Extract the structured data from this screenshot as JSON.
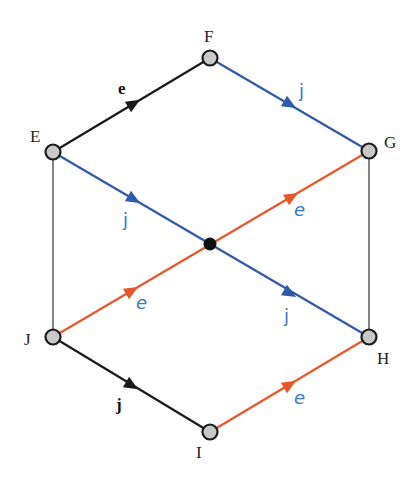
{
  "colors": {
    "black_edge": "#1a1a1a",
    "blue_edge": "#2f5aa8",
    "orange_edge": "#e8572a",
    "thin_edge": "#333333",
    "node_fill": "#c8c8c8",
    "node_stroke": "#1a1a1a",
    "center_fill": "#111111",
    "label_blue": "#3a78c8"
  },
  "nodes": [
    {
      "id": "E",
      "label": "E",
      "x": 53,
      "y": 152
    },
    {
      "id": "F",
      "label": "F",
      "x": 210,
      "y": 58
    },
    {
      "id": "G",
      "label": "G",
      "x": 369,
      "y": 151
    },
    {
      "id": "H",
      "label": "H",
      "x": 369,
      "y": 337
    },
    {
      "id": "I",
      "label": "I",
      "x": 210,
      "y": 432
    },
    {
      "id": "J",
      "label": "J",
      "x": 53,
      "y": 337
    },
    {
      "id": "C",
      "label": "",
      "x": 210,
      "y": 244
    }
  ],
  "edges": [
    {
      "from": "E",
      "to": "F",
      "label": "e",
      "color": "black",
      "arrow": true
    },
    {
      "from": "F",
      "to": "G",
      "label": "j",
      "color": "blue",
      "arrow": true
    },
    {
      "from": "E",
      "to": "H",
      "label": "j",
      "color": "blue",
      "arrow": true,
      "note": "passes through center, two arrows"
    },
    {
      "from": "J",
      "to": "G",
      "label": "e",
      "color": "orange",
      "arrow": true,
      "note": "passes through center, two arrows"
    },
    {
      "from": "J",
      "to": "I",
      "label": "j",
      "color": "black",
      "arrow": true
    },
    {
      "from": "I",
      "to": "H",
      "label": "e",
      "color": "orange",
      "arrow": true
    },
    {
      "from": "E",
      "to": "J",
      "label": "",
      "color": "thin",
      "arrow": false
    },
    {
      "from": "G",
      "to": "H",
      "label": "",
      "color": "thin",
      "arrow": false
    }
  ],
  "labels": {
    "node_E": "E",
    "node_F": "F",
    "node_G": "G",
    "node_H": "H",
    "node_I": "I",
    "node_J": "J",
    "edge_EF": "e",
    "edge_FG": "j",
    "edge_EC": "j",
    "edge_CH": "j",
    "edge_JC": "e",
    "edge_CG": "e",
    "edge_JI": "j",
    "edge_IH": "e"
  }
}
